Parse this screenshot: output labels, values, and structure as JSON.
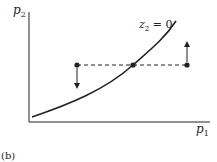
{
  "diagram": {
    "y_axis_label": "p",
    "y_axis_sub": "2",
    "x_axis_label": "p",
    "x_axis_sub": "1",
    "curve_label_var": "z",
    "curve_label_sub": "2",
    "curve_label_eq": " = 0",
    "caption": "(b)",
    "points": [
      {
        "name": "left-point",
        "arrow": "down"
      },
      {
        "name": "equilibrium-point",
        "arrow": "none"
      },
      {
        "name": "right-point",
        "arrow": "up"
      }
    ],
    "colors": {
      "ink": "#222222",
      "background": "#ffffff"
    }
  }
}
